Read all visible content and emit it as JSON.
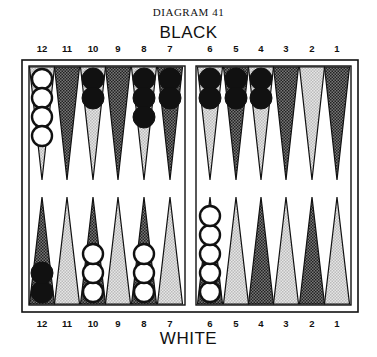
{
  "caption": "DIAGRAM 41",
  "top_player": "BLACK",
  "bottom_player": "WHITE",
  "point_numbers": [
    "12",
    "11",
    "10",
    "9",
    "8",
    "7",
    "6",
    "5",
    "4",
    "3",
    "2",
    "1"
  ],
  "colors": {
    "dark_point": "#555555",
    "light_point": "#cfcfcf",
    "black_checker": "#111111",
    "white_checker": "#ffffff",
    "line": "#111111"
  },
  "board": {
    "top_points": [
      {
        "point": "12",
        "shade": "light",
        "checkers": {
          "color": "white",
          "count": 4
        }
      },
      {
        "point": "11",
        "shade": "dark",
        "checkers": {
          "color": "none",
          "count": 0
        }
      },
      {
        "point": "10",
        "shade": "light",
        "checkers": {
          "color": "black",
          "count": 2
        }
      },
      {
        "point": "9",
        "shade": "dark",
        "checkers": {
          "color": "none",
          "count": 0
        }
      },
      {
        "point": "8",
        "shade": "light",
        "checkers": {
          "color": "black",
          "count": 3
        }
      },
      {
        "point": "7",
        "shade": "dark",
        "checkers": {
          "color": "black",
          "count": 2
        }
      },
      {
        "point": "6",
        "shade": "light",
        "checkers": {
          "color": "black",
          "count": 2
        }
      },
      {
        "point": "5",
        "shade": "dark",
        "checkers": {
          "color": "black",
          "count": 2
        }
      },
      {
        "point": "4",
        "shade": "light",
        "checkers": {
          "color": "black",
          "count": 2
        }
      },
      {
        "point": "3",
        "shade": "dark",
        "checkers": {
          "color": "none",
          "count": 0
        }
      },
      {
        "point": "2",
        "shade": "light",
        "checkers": {
          "color": "none",
          "count": 0
        }
      },
      {
        "point": "1",
        "shade": "dark",
        "checkers": {
          "color": "none",
          "count": 0
        }
      }
    ],
    "bottom_points": [
      {
        "point": "12",
        "shade": "dark",
        "checkers": {
          "color": "black",
          "count": 2
        }
      },
      {
        "point": "11",
        "shade": "light",
        "checkers": {
          "color": "none",
          "count": 0
        }
      },
      {
        "point": "10",
        "shade": "dark",
        "checkers": {
          "color": "white",
          "count": 3
        }
      },
      {
        "point": "9",
        "shade": "light",
        "checkers": {
          "color": "none",
          "count": 0
        }
      },
      {
        "point": "8",
        "shade": "dark",
        "checkers": {
          "color": "white",
          "count": 3
        }
      },
      {
        "point": "7",
        "shade": "light",
        "checkers": {
          "color": "none",
          "count": 0
        }
      },
      {
        "point": "6",
        "shade": "dark",
        "checkers": {
          "color": "white",
          "count": 5
        }
      },
      {
        "point": "5",
        "shade": "light",
        "checkers": {
          "color": "none",
          "count": 0
        }
      },
      {
        "point": "4",
        "shade": "dark",
        "checkers": {
          "color": "none",
          "count": 0
        }
      },
      {
        "point": "3",
        "shade": "light",
        "checkers": {
          "color": "none",
          "count": 0
        }
      },
      {
        "point": "2",
        "shade": "dark",
        "checkers": {
          "color": "none",
          "count": 0
        }
      },
      {
        "point": "1",
        "shade": "light",
        "checkers": {
          "color": "none",
          "count": 0
        }
      }
    ]
  }
}
